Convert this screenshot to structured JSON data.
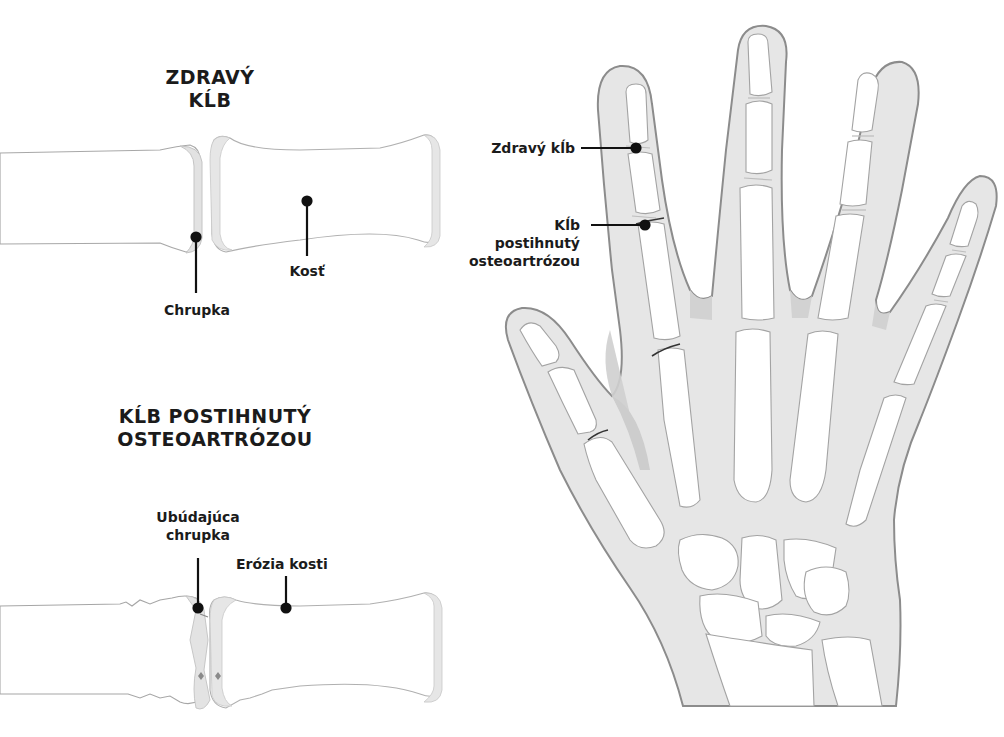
{
  "healthy_panel": {
    "title_line1": "ZDRAVÝ",
    "title_line2": "KĹB",
    "labels": {
      "cartilage": "Chrupka",
      "bone": "Kosť"
    }
  },
  "oa_panel": {
    "title_line1": "KĹB POSTIHNUTÝ",
    "title_line2": "OSTEOARTRÓZOU",
    "labels": {
      "cartilage_line1": "Ubúdajúca",
      "cartilage_line2": "chrupka",
      "bone_erosion": "Erózia kosti"
    }
  },
  "hand_panel": {
    "labels": {
      "healthy_joint": "Zdravý kĺb",
      "oa_joint_line1": "Kĺb",
      "oa_joint_line2": "postihnutý",
      "oa_joint_line3": "osteoartrózou"
    }
  },
  "colors": {
    "bone_fill": "#ffffff",
    "bone_outline": "#9a9a9a",
    "cartilage": "#e4e4e4",
    "flesh": "#e8e8e8",
    "flesh_edge": "#c9c9c9",
    "hand_outline": "#8a8a8a",
    "callout": "#111111"
  }
}
